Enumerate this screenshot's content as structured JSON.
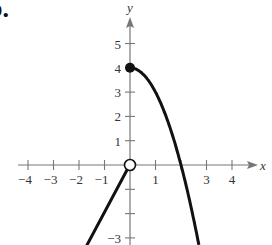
{
  "figure": {
    "part_label": "b."
  },
  "chart_data": {
    "type": "line",
    "title": "",
    "xlabel": "x",
    "ylabel": "y",
    "xlim": [
      -4.3,
      4.8
    ],
    "ylim": [
      -3.3,
      5.6
    ],
    "x_ticks": [
      -4,
      -3,
      -2,
      -1,
      1,
      2,
      3,
      4
    ],
    "x_tick_labels": [
      "-4",
      "-3",
      "-2",
      "-1",
      "1",
      "3",
      "4"
    ],
    "y_ticks": [
      -3,
      -2,
      -1,
      1,
      2,
      3,
      4,
      5
    ],
    "y_tick_labels": [
      "-3",
      "1",
      "2",
      "3",
      "4",
      "5"
    ],
    "grid": false,
    "series": [
      {
        "name": "left piece (x < 0)",
        "function": "y = 2x",
        "domain": [
          -1.69,
          0
        ],
        "points": [
          [
            -1.69,
            -3.3
          ],
          [
            0,
            0
          ]
        ],
        "end_markers": {
          "right": "open circle at (0,0)"
        }
      },
      {
        "name": "right piece (x >= 0)",
        "function": "y = 4 - x^2",
        "domain": [
          0,
          2.67
        ],
        "points": [
          [
            0,
            4
          ],
          [
            0.5,
            3.75
          ],
          [
            1,
            3
          ],
          [
            1.5,
            1.75
          ],
          [
            2,
            0
          ],
          [
            2.5,
            -2.25
          ],
          [
            2.67,
            -3.13
          ]
        ],
        "end_markers": {
          "left": "closed dot at (0,4)"
        }
      }
    ],
    "markers": [
      {
        "type": "closed",
        "x": 0,
        "y": 4
      },
      {
        "type": "open",
        "x": 0,
        "y": 0
      }
    ]
  }
}
